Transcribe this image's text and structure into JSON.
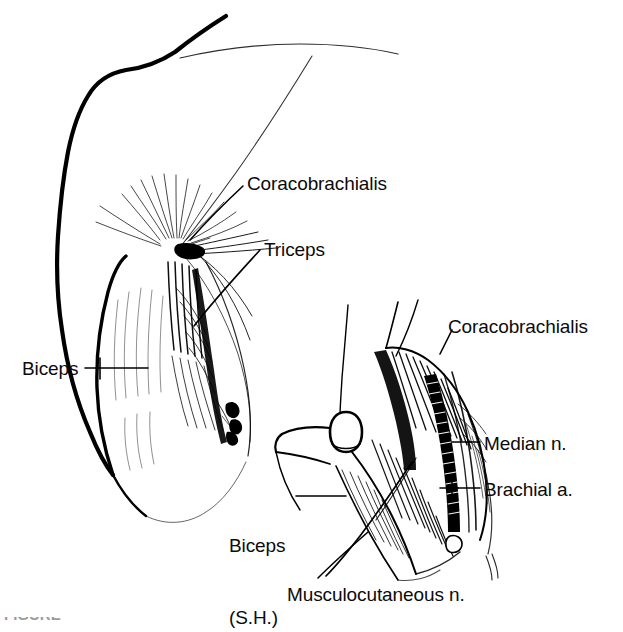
{
  "figure": {
    "kind": "anatomical-line-drawing",
    "background_color": "#ffffff",
    "ink_color": "#000000",
    "caption_partial": "FIGURE"
  },
  "labels": {
    "left_figure": [
      {
        "id": "coracobrachialis",
        "text": "Coracobrachialis",
        "x": 247,
        "y": 172
      },
      {
        "id": "triceps",
        "text": "Triceps",
        "x": 264,
        "y": 238
      },
      {
        "id": "biceps",
        "text": "Biceps",
        "x": 22,
        "y": 357
      }
    ],
    "right_figure": [
      {
        "id": "coracobrachialis-2",
        "text": "Coracobrachialis",
        "x": 448,
        "y": 315
      },
      {
        "id": "median-nerve",
        "text": "Median n.",
        "x": 484,
        "y": 432
      },
      {
        "id": "brachial-artery",
        "text": "Brachial a.",
        "x": 484,
        "y": 478
      },
      {
        "id": "biceps-short-head",
        "line1": "Biceps",
        "line2": "(S.H.)",
        "x": 229,
        "y": 486
      },
      {
        "id": "musculocutaneous-nerve",
        "text": "Musculocutaneous n.",
        "x": 287,
        "y": 583
      }
    ]
  },
  "colors": {
    "ink": "#000000",
    "background": "#ffffff",
    "label_text": "#0b0b0b",
    "light_ink": "#555555"
  }
}
